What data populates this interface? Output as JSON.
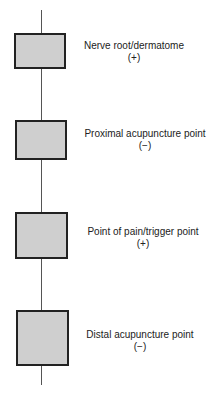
{
  "diagram": {
    "nodes": [
      {
        "label": "Nerve root/dermatome",
        "sign": "(+)"
      },
      {
        "label": "Proximal acupuncture point",
        "sign": "(−)"
      },
      {
        "label": "Point of pain/trigger point",
        "sign": "(+)"
      },
      {
        "label": "Distal acupuncture point",
        "sign": "(−)"
      }
    ]
  }
}
